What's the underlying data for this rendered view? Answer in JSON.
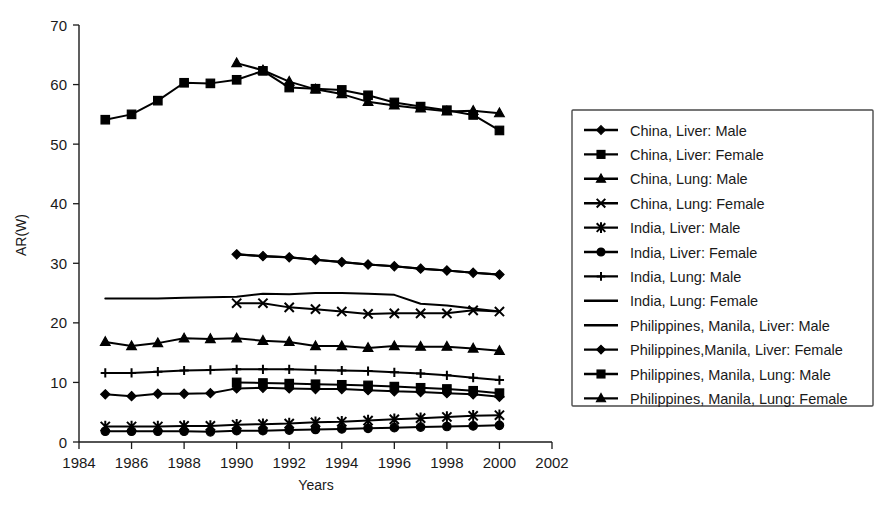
{
  "chart_data": {
    "type": "line",
    "title": "",
    "xlabel": "Years",
    "ylabel": "AR(W)",
    "xlim": [
      1984,
      2002
    ],
    "ylim": [
      0,
      70
    ],
    "xticks": [
      1984,
      1986,
      1988,
      1990,
      1992,
      1994,
      1996,
      1998,
      2000,
      2002
    ],
    "yticks": [
      0,
      10,
      20,
      30,
      40,
      50,
      60,
      70
    ],
    "xtick_labels": [
      "1984",
      "1986",
      "1988",
      "1990",
      "1992",
      "1994",
      "1996",
      "1998",
      "2000",
      "2002"
    ],
    "ytick_labels": [
      "0",
      "10",
      "20",
      "30",
      "40",
      "50",
      "60",
      "70"
    ],
    "grid": false,
    "legend_position": "right",
    "series": [
      {
        "name": "China, Liver: Male",
        "marker": "diamond",
        "x": [
          1985,
          1986,
          1987,
          1988,
          1989,
          1990,
          1991,
          1992,
          1993,
          1994,
          1995,
          1996,
          1997,
          1998,
          1999,
          2000
        ],
        "values": [
          8.0,
          7.7,
          8.1,
          8.1,
          8.2,
          9.0,
          9.1,
          9.0,
          8.9,
          8.9,
          8.7,
          8.5,
          8.4,
          8.2,
          8.0,
          7.6
        ]
      },
      {
        "name": "China, Liver: Female",
        "marker": "square",
        "x": [
          1990,
          1991,
          1992,
          1993,
          1994,
          1995,
          1996,
          1997,
          1998,
          1999,
          2000
        ],
        "values": [
          10.0,
          9.9,
          9.8,
          9.7,
          9.6,
          9.5,
          9.3,
          9.1,
          8.9,
          8.6,
          8.2
        ]
      },
      {
        "name": "China, Lung: Male",
        "marker": "triangle",
        "x": [
          1985,
          1986,
          1987,
          1988,
          1989,
          1990,
          1991,
          1992,
          1993,
          1994,
          1995,
          1996,
          1997,
          1998,
          1999,
          2000
        ],
        "values": [
          16.8,
          16.1,
          16.6,
          17.4,
          17.3,
          17.4,
          17.0,
          16.8,
          16.1,
          16.1,
          15.8,
          16.1,
          16.0,
          16.0,
          15.7,
          15.3
        ]
      },
      {
        "name": "China, Lung: Female",
        "marker": "x",
        "x": [
          1990,
          1991,
          1992,
          1993,
          1994,
          1995,
          1996,
          1997,
          1998,
          1999,
          2000
        ],
        "values": [
          23.3,
          23.3,
          22.6,
          22.3,
          21.9,
          21.5,
          21.6,
          21.6,
          21.6,
          22.1,
          21.9
        ]
      },
      {
        "name": "India, Liver: Male",
        "marker": "asterisk",
        "x": [
          1985,
          1986,
          1987,
          1988,
          1989,
          1990,
          1991,
          1992,
          1993,
          1994,
          1995,
          1996,
          1997,
          1998,
          1999,
          2000
        ],
        "values": [
          2.6,
          2.6,
          2.6,
          2.7,
          2.7,
          2.9,
          3.0,
          3.1,
          3.3,
          3.4,
          3.6,
          3.8,
          4.0,
          4.2,
          4.4,
          4.5
        ]
      },
      {
        "name": "India, Liver: Female",
        "marker": "circle",
        "x": [
          1985,
          1986,
          1987,
          1988,
          1989,
          1990,
          1991,
          1992,
          1993,
          1994,
          1995,
          1996,
          1997,
          1998,
          1999,
          2000
        ],
        "values": [
          1.8,
          1.8,
          1.8,
          1.8,
          1.7,
          1.9,
          1.9,
          2.0,
          2.1,
          2.2,
          2.3,
          2.4,
          2.5,
          2.6,
          2.7,
          2.8
        ]
      },
      {
        "name": "India, Lung: Male",
        "marker": "plus",
        "x": [
          1985,
          1986,
          1987,
          1988,
          1989,
          1990,
          1991,
          1992,
          1993,
          1994,
          1995,
          1996,
          1997,
          1998,
          1999,
          2000
        ],
        "values": [
          11.6,
          11.6,
          11.8,
          12.0,
          12.1,
          12.2,
          12.2,
          12.2,
          12.1,
          12.0,
          11.9,
          11.7,
          11.5,
          11.2,
          10.8,
          10.4
        ]
      },
      {
        "name": "India, Lung: Female",
        "marker": "none",
        "x": [
          1985,
          1986,
          1987,
          1988,
          1989,
          1990,
          1991,
          1992,
          1993,
          1994,
          1995,
          1996,
          1997,
          1998,
          1999,
          2000
        ],
        "values": [
          24.1,
          24.1,
          24.1,
          24.2,
          24.3,
          24.4,
          24.9,
          24.8,
          25.0,
          25.0,
          24.9,
          24.7,
          23.2,
          22.9,
          22.4,
          21.9
        ]
      },
      {
        "name": "Philippines, Manila, Liver: Male",
        "marker": "line-thick",
        "x": [
          1990,
          1991,
          1992,
          1993,
          1994,
          1995,
          1996,
          1997,
          1998,
          1999,
          2000
        ],
        "values": [
          31.5,
          31.2,
          31.0,
          30.6,
          30.2,
          29.8,
          29.5,
          29.1,
          28.8,
          28.4,
          28.1
        ]
      },
      {
        "name": "Philippines,Manila, Liver: Female",
        "marker": "diamond",
        "x": [
          1990,
          1991,
          1992,
          1993,
          1994,
          1995,
          1996,
          1997,
          1998,
          1999,
          2000
        ],
        "values": [
          31.5,
          31.2,
          31.0,
          30.6,
          30.2,
          29.8,
          29.5,
          29.1,
          28.8,
          28.4,
          28.1
        ]
      },
      {
        "name": "Philippines, Manila, Lung: Male",
        "marker": "square",
        "x": [
          1985,
          1986,
          1987,
          1988,
          1989,
          1990,
          1991,
          1992,
          1993,
          1994,
          1995,
          1996,
          1997,
          1998,
          1999,
          2000
        ],
        "values": [
          54.1,
          55.0,
          57.3,
          60.3,
          60.2,
          60.8,
          62.3,
          59.5,
          59.3,
          59.1,
          58.2,
          57.0,
          56.3,
          55.7,
          54.9,
          52.3
        ]
      },
      {
        "name": "Philippines, Manila, Lung: Female",
        "marker": "triangle",
        "x": [
          1990,
          1991,
          1992,
          1993,
          1994,
          1995,
          1996,
          1997,
          1998,
          1999,
          2000
        ],
        "values": [
          63.6,
          62.4,
          60.5,
          59.2,
          58.4,
          57.1,
          56.5,
          56.0,
          55.5,
          55.6,
          55.2
        ]
      }
    ]
  },
  "legend": {
    "items": [
      {
        "label": "China, Liver: Male",
        "marker": "diamond"
      },
      {
        "label": "China, Liver: Female",
        "marker": "square"
      },
      {
        "label": "China, Lung: Male",
        "marker": "triangle"
      },
      {
        "label": "China, Lung: Female",
        "marker": "x"
      },
      {
        "label": "India, Liver: Male",
        "marker": "asterisk"
      },
      {
        "label": "India, Liver: Female",
        "marker": "circle"
      },
      {
        "label": "India, Lung: Male",
        "marker": "plus"
      },
      {
        "label": "India, Lung: Female",
        "marker": "none"
      },
      {
        "label": "Philippines, Manila, Liver: Male",
        "marker": "line-thick"
      },
      {
        "label": "Philippines,Manila, Liver: Female",
        "marker": "diamond"
      },
      {
        "label": "Philippines, Manila, Lung: Male",
        "marker": "square"
      },
      {
        "label": "Philippines, Manila, Lung: Female",
        "marker": "triangle"
      }
    ]
  },
  "colors": {
    "ink": "#000000",
    "axis": "#1a1a1a",
    "background": "#ffffff",
    "legend_border": "#4a4a4a"
  }
}
